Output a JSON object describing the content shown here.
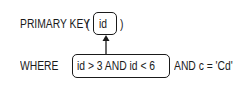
{
  "line1": {
    "keyword": "PRIMARY KEY",
    "open_paren": "(",
    "column": "id",
    "close_paren": ")"
  },
  "line2": {
    "keyword": "WHERE",
    "boxed_condition": "id > 3  AND  id < 6",
    "rest": "AND c = 'Cd'"
  },
  "colors": {
    "stroke": "#1a1a1a",
    "background": "#ffffff"
  }
}
